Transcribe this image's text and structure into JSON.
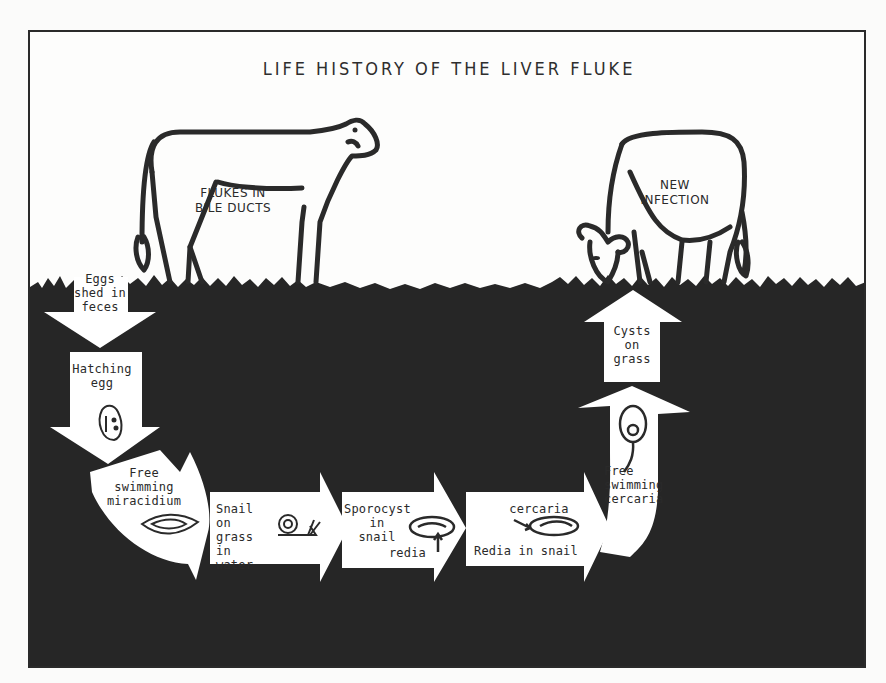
{
  "title": "LIFE HISTORY OF THE LIVER FLUKE",
  "colors": {
    "ground": "#262626",
    "arrow": "#ffffff",
    "ink": "#2a2a2a",
    "paper": "#fdfdfc"
  },
  "cows": {
    "left": {
      "label": "FLUKES IN\nBILE DUCTS"
    },
    "right": {
      "label": "NEW\nINFECTION"
    }
  },
  "stages": [
    {
      "id": "eggs",
      "label": "Eggs\nshed in\nfeces",
      "arrow": "down"
    },
    {
      "id": "hatching",
      "label": "Hatching\negg",
      "arrow": "down",
      "icon": "egg-icon"
    },
    {
      "id": "miracidium",
      "label": "Free\nswimming\nmiracidium",
      "arrow": "curve-right",
      "icon": "miracidium-icon"
    },
    {
      "id": "snail",
      "label": "Snail\non\ngrass\nin water",
      "arrow": "right",
      "icon": "snail-icon"
    },
    {
      "id": "sporocyst",
      "label": "Sporocyst\nin\nsnail",
      "sub_label": "redia",
      "arrow": "right",
      "icon": "sporocyst-icon"
    },
    {
      "id": "redia",
      "label": "Redia in snail",
      "sub_label": "cercaria",
      "arrow": "right",
      "icon": "redia-icon"
    },
    {
      "id": "cercaria",
      "label": "Free\nswimming\ncercaria",
      "arrow": "curve-up",
      "icon": "cercaria-icon"
    },
    {
      "id": "cysts",
      "label": "Cysts\non\ngrass",
      "arrow": "up"
    }
  ]
}
